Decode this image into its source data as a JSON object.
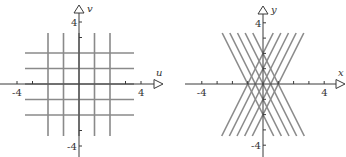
{
  "figures": [
    {
      "id": "uv-plane",
      "x_axis_label": "u",
      "y_axis_label": "v",
      "tick_labels": {
        "x_neg": "-4",
        "x_pos": "4",
        "y_pos": "4",
        "y_neg": "-4"
      },
      "vertical_lines_u": [
        -2,
        -1,
        0,
        1,
        2
      ],
      "horizontal_lines_v": [
        -2,
        -1,
        0,
        1,
        2
      ],
      "line_color": "#8a8a8a"
    },
    {
      "id": "xy-plane",
      "x_axis_label": "x",
      "y_axis_label": "y",
      "tick_labels": {
        "x_neg": "-4",
        "x_pos": "4",
        "y_pos": "4",
        "y_neg": "-4"
      },
      "lines_slope_pos": {
        "slope": 2,
        "intercepts": [
          -2,
          -1,
          0,
          1,
          2
        ]
      },
      "lines_slope_neg": {
        "slope": -2,
        "intercepts": [
          -2,
          -1,
          0,
          1,
          2
        ]
      },
      "line_color": "#8a8a8a"
    }
  ],
  "chart_data": [
    {
      "type": "line",
      "title": "",
      "xlabel": "u",
      "ylabel": "v",
      "xlim": [
        -4.3,
        4.3
      ],
      "ylim": [
        -4.6,
        5
      ],
      "series": [
        {
          "name": "u = -2",
          "kind": "vertical",
          "value": -2
        },
        {
          "name": "u = -1",
          "kind": "vertical",
          "value": -1
        },
        {
          "name": "u = 0",
          "kind": "vertical",
          "value": 0
        },
        {
          "name": "u = 1",
          "kind": "vertical",
          "value": 1
        },
        {
          "name": "u = 2",
          "kind": "vertical",
          "value": 2
        },
        {
          "name": "v = -2",
          "kind": "horizontal",
          "value": -2
        },
        {
          "name": "v = -1",
          "kind": "horizontal",
          "value": -1
        },
        {
          "name": "v = 0",
          "kind": "horizontal",
          "value": 0
        },
        {
          "name": "v = 1",
          "kind": "horizontal",
          "value": 1
        },
        {
          "name": "v = 2",
          "kind": "horizontal",
          "value": 2
        }
      ],
      "ticks": [
        -4,
        -3,
        3,
        4
      ],
      "grid": false
    },
    {
      "type": "line",
      "title": "",
      "xlabel": "x",
      "ylabel": "y",
      "xlim": [
        -4.3,
        4.3
      ],
      "ylim": [
        -4.6,
        5
      ],
      "series": [
        {
          "name": "y = 2x - 2",
          "slope": 2,
          "intercept": -2
        },
        {
          "name": "y = 2x - 1",
          "slope": 2,
          "intercept": -1
        },
        {
          "name": "y = 2x",
          "slope": 2,
          "intercept": 0
        },
        {
          "name": "y = 2x + 1",
          "slope": 2,
          "intercept": 1
        },
        {
          "name": "y = 2x + 2",
          "slope": 2,
          "intercept": 2
        },
        {
          "name": "y = -2x - 2",
          "slope": -2,
          "intercept": -2
        },
        {
          "name": "y = -2x - 1",
          "slope": -2,
          "intercept": -1
        },
        {
          "name": "y = -2x",
          "slope": -2,
          "intercept": 0
        },
        {
          "name": "y = -2x + 1",
          "slope": -2,
          "intercept": 1
        },
        {
          "name": "y = -2x + 2",
          "slope": -2,
          "intercept": 2
        }
      ],
      "y_range_of_lines": [
        -3.4,
        3.3
      ],
      "ticks": [
        -4,
        -3,
        -2,
        -1,
        1,
        2,
        3,
        4
      ],
      "grid": false
    }
  ]
}
